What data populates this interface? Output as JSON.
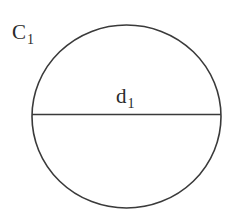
{
  "diagram": {
    "type": "circle-with-diameter",
    "stroke_color": "#3a3a3a",
    "background": "#ffffff",
    "circle": {
      "label_main": "C",
      "label_sub": "1",
      "cx": 126.5,
      "cy": 116.5,
      "r": 92.5
    },
    "diameter": {
      "label_main": "d",
      "label_sub": "1",
      "x1": 32,
      "x2": 221,
      "y": 114.5
    }
  }
}
